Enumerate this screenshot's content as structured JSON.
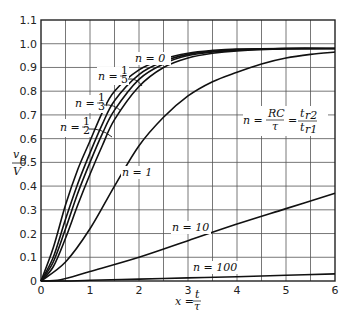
{
  "chart_data": {
    "type": "line",
    "title": "",
    "xlabel": "x = t/τ",
    "ylabel": "v_o/V",
    "xlim": [
      0,
      6
    ],
    "ylim": [
      0,
      1.1
    ],
    "grid": true,
    "x_ticks": [
      "0",
      "1",
      "2",
      "3",
      "4",
      "5",
      "6"
    ],
    "y_ticks": [
      "0",
      "0.1",
      "0.2",
      "0.3",
      "0.4",
      "0.5",
      "0.6",
      "0.7",
      "0.8",
      "0.9",
      "1.0",
      "1.1"
    ],
    "annotation": "n = RC/τ = t_r2/t_r1",
    "series": [
      {
        "name": "n = 0",
        "x": [
          0,
          0.25,
          0.5,
          0.75,
          1,
          1.25,
          1.5,
          2,
          2.5,
          3,
          3.5,
          4,
          5,
          6
        ],
        "y": [
          0,
          0.14,
          0.32,
          0.47,
          0.59,
          0.71,
          0.8,
          0.89,
          0.935,
          0.96,
          0.972,
          0.978,
          0.98,
          0.98
        ]
      },
      {
        "name": "n = 1/5",
        "x": [
          0,
          0.25,
          0.5,
          0.75,
          1,
          1.25,
          1.5,
          2,
          2.5,
          3,
          3.5,
          4,
          5,
          6
        ],
        "y": [
          0,
          0.1,
          0.26,
          0.41,
          0.54,
          0.66,
          0.76,
          0.87,
          0.925,
          0.955,
          0.968,
          0.975,
          0.98,
          0.98
        ]
      },
      {
        "name": "n = 1/3",
        "x": [
          0,
          0.25,
          0.5,
          0.75,
          1,
          1.25,
          1.5,
          2,
          2.5,
          3,
          3.5,
          4,
          5,
          6
        ],
        "y": [
          0,
          0.08,
          0.22,
          0.37,
          0.5,
          0.62,
          0.72,
          0.85,
          0.915,
          0.95,
          0.965,
          0.973,
          0.98,
          0.98
        ]
      },
      {
        "name": "n = 1/2",
        "x": [
          0,
          0.25,
          0.5,
          0.75,
          1,
          1.25,
          1.5,
          2,
          2.5,
          3,
          3.5,
          4,
          5,
          6
        ],
        "y": [
          0,
          0.06,
          0.18,
          0.32,
          0.45,
          0.57,
          0.68,
          0.82,
          0.9,
          0.94,
          0.96,
          0.97,
          0.978,
          0.98
        ]
      },
      {
        "name": "n = 1",
        "x": [
          0,
          0.5,
          1,
          1.5,
          2,
          2.5,
          3,
          3.5,
          4,
          4.5,
          5,
          5.5,
          6
        ],
        "y": [
          0,
          0.08,
          0.22,
          0.4,
          0.57,
          0.69,
          0.78,
          0.84,
          0.88,
          0.915,
          0.94,
          0.955,
          0.965
        ]
      },
      {
        "name": "n = 10",
        "x": [
          0,
          0.4,
          1,
          2,
          3,
          4,
          5,
          6
        ],
        "y": [
          0,
          0.005,
          0.04,
          0.1,
          0.17,
          0.24,
          0.305,
          0.37
        ]
      },
      {
        "name": "n = 100",
        "x": [
          0,
          0.5,
          1,
          2,
          3,
          4,
          5,
          6
        ],
        "y": [
          0,
          0.0,
          0.003,
          0.008,
          0.013,
          0.018,
          0.024,
          0.03
        ]
      }
    ],
    "series_labels": [
      {
        "text": "n = 0",
        "x": 1.5,
        "y": 0.82
      },
      {
        "text": "n = 1/5",
        "x": 1.2,
        "y": 0.78
      },
      {
        "text": "n = 1/3",
        "x": 0.75,
        "y": 0.7
      },
      {
        "text": "n = 1/2",
        "x": 0.45,
        "y": 0.6
      },
      {
        "text": "n = 1",
        "x": 1.25,
        "y": 0.43
      },
      {
        "text": "n = 10",
        "x": 2.35,
        "y": 0.2
      },
      {
        "text": "n = 100",
        "x": 3.0,
        "y": 0.06
      }
    ]
  },
  "labels": {
    "y_axis_num": "v",
    "y_axis_sub": "o",
    "y_axis_den": "V",
    "x_axis_prefix": "x =",
    "x_axis_num": "t",
    "x_axis_den": "τ",
    "n0": "n = 0",
    "n5_prefix": "n =",
    "n5_frac_num": "1",
    "n5_frac_den": "5",
    "n3_prefix": "n =",
    "n3_frac_num": "1",
    "n3_frac_den": "3",
    "n2_prefix": "n =",
    "n2_frac_num": "1",
    "n2_frac_den": "2",
    "n1": "n = 1",
    "n10": "n = 10",
    "n100": "n = 100",
    "formula_n": "n =",
    "formula_num": "RC",
    "formula_den": "τ",
    "formula_eq": "=",
    "formula_num2": "t",
    "formula_num2_sub": "r2",
    "formula_den2": "t",
    "formula_den2_sub": "r1"
  }
}
